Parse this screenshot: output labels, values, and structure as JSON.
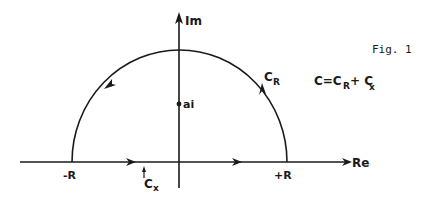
{
  "figure": {
    "caption": "Fig. 1",
    "colors": {
      "ink": "#1a1a1a",
      "background": "#ffffff"
    }
  },
  "axes": {
    "imaginary_label": "Im",
    "real_label": "Re"
  },
  "points": {
    "pole_label": "ai",
    "minus_R_label": "-R",
    "plus_R_label": "+R"
  },
  "contours": {
    "arc_label_main": "C",
    "arc_label_sub": "R",
    "segment_label_main": "C",
    "segment_label_sub": "x"
  },
  "equation": {
    "lhs": "C=C",
    "sub1": "R",
    "plus": "+ C",
    "sub2": "x"
  }
}
